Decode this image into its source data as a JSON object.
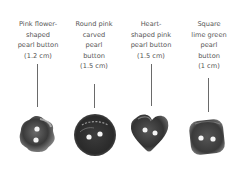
{
  "buttons": [
    {
      "lines": [
        "Pink flower-",
        "shaped",
        "pearl button",
        "(1.2 cm)"
      ]
    },
    {
      "lines": [
        "Round pink",
        "carved",
        "pearl",
        "button",
        "(1.5 cm)"
      ]
    },
    {
      "lines": [
        "Heart-",
        "shaped pink",
        "pearl button",
        "(1.5 cm)"
      ]
    },
    {
      "lines": [
        "Square",
        "lime green",
        "pearl",
        "button",
        "(1 cm)"
      ]
    }
  ]
}
